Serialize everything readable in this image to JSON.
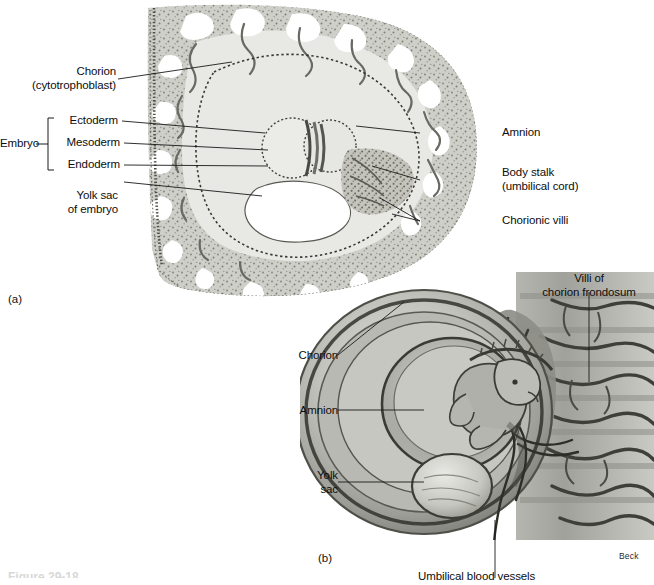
{
  "figure": {
    "type": "anatomical-illustration",
    "credit": "Beck",
    "caption_cut": "Figure 29-18"
  },
  "panels": [
    {
      "tag": "(a)",
      "name": "histological-cross-section",
      "labels": {
        "chorion": "Chorion\n(cytotrophoblast)",
        "embryo_bracket": "Embryo",
        "ectoderm": "Ectoderm",
        "mesoderm": "Mesoderm",
        "endoderm": "Endoderm",
        "yolk_sac": "Yolk sac\nof embryo",
        "amnion": "Amnion",
        "body_stalk": "Body stalk\n(umbilical cord)",
        "chorionic_villi": "Chorionic villi"
      }
    },
    {
      "tag": "(b)",
      "name": "fetus-in-amniotic-sac",
      "labels": {
        "chorion": "Chorion",
        "amnion": "Amnion",
        "yolk_sac": "Yolk\nsac",
        "villi_frondosum": "Villi of\nchorion frondosum",
        "umbilical_vessels": "Umbilical blood vessels"
      }
    }
  ],
  "colors": {
    "background": "#ffffff",
    "ink": "#111111",
    "tissue_light": "#d8d8d4",
    "tissue_mid": "#b4b4ae",
    "tissue_dark": "#8a8a84",
    "tissue_deep": "#5e5e58",
    "lacuna": "#ffffff",
    "membrane": "#6f6f69"
  }
}
